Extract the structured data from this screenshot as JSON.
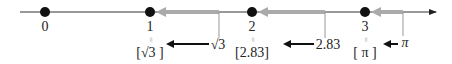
{
  "number_line": {
    "ticks": [
      {
        "label": "0",
        "x": 45
      },
      {
        "label": "1",
        "x": 150
      },
      {
        "label": "2",
        "x": 252
      },
      {
        "label": "3",
        "x": 365
      }
    ],
    "line_color": "#333333",
    "dot_color": "#111111"
  },
  "values": [
    {
      "label": "√3",
      "x": 219,
      "floor_label": "[√3 ]",
      "floor_of": "1"
    },
    {
      "label": "2.83",
      "x": 325,
      "floor_label": "[2.83]",
      "floor_of": "2"
    },
    {
      "label": "π",
      "x": 403,
      "floor_label": "[ π ]",
      "floor_of": "3"
    }
  ],
  "equals_sign": "=",
  "colors": {
    "gray_arrow": "#aaaaaa",
    "black_arrow": "#111111",
    "thin_line": "#999999"
  }
}
